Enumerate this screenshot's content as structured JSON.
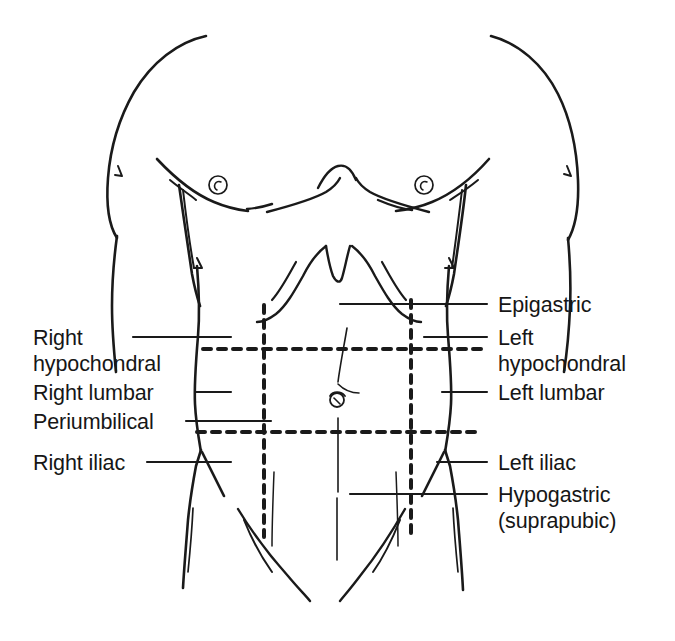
{
  "figure": {
    "stroke_color": "#1a1a1a",
    "background_color": "#ffffff",
    "text_color": "#161616"
  },
  "labels_left": [
    {
      "id": "right-hypochondral",
      "line1": "Right",
      "line2": "hypochondral",
      "x": 33,
      "y": 326,
      "leader": {
        "x1": 133,
        "y1": 337,
        "x2": 231,
        "y2": 337
      }
    },
    {
      "id": "right-lumbar",
      "line1": "Right lumbar",
      "line2": "",
      "x": 33,
      "y": 381,
      "leader": {
        "x1": 196,
        "y1": 392,
        "x2": 231,
        "y2": 392
      }
    },
    {
      "id": "periumbilical",
      "line1": "Periumbilical",
      "line2": "",
      "x": 33,
      "y": 410,
      "leader": {
        "x1": 186,
        "y1": 421,
        "x2": 271,
        "y2": 421
      }
    },
    {
      "id": "right-iliac",
      "line1": "Right iliac",
      "line2": "",
      "x": 33,
      "y": 451,
      "leader": {
        "x1": 147,
        "y1": 462,
        "x2": 231,
        "y2": 462
      }
    }
  ],
  "labels_right": [
    {
      "id": "epigastric",
      "line1": "Epigastric",
      "line2": "",
      "x": 498,
      "y": 293,
      "leader": {
        "x1": 340,
        "y1": 304,
        "x2": 487,
        "y2": 304
      }
    },
    {
      "id": "left-hypochondral",
      "line1": "Left",
      "line2": "hypochondral",
      "x": 498,
      "y": 326,
      "leader": {
        "x1": 424,
        "y1": 337,
        "x2": 487,
        "y2": 337
      }
    },
    {
      "id": "left-lumbar",
      "line1": "Left lumbar",
      "line2": "",
      "x": 498,
      "y": 381,
      "leader": {
        "x1": 442,
        "y1": 392,
        "x2": 487,
        "y2": 392
      }
    },
    {
      "id": "left-iliac",
      "line1": "Left iliac",
      "line2": "",
      "x": 498,
      "y": 451,
      "leader": {
        "x1": 437,
        "y1": 462,
        "x2": 487,
        "y2": 462
      }
    },
    {
      "id": "hypogastric",
      "line1": "Hypogastric",
      "line2": "(suprapubic)",
      "x": 498,
      "y": 483,
      "leader": {
        "x1": 350,
        "y1": 494,
        "x2": 487,
        "y2": 494
      }
    }
  ],
  "region_lines": {
    "vertical_left": {
      "id": "right-midclavicular-line",
      "x": 264,
      "y1": 305,
      "y2": 537
    },
    "vertical_right": {
      "id": "left-midclavicular-line",
      "x": 411,
      "y1": 300,
      "y2": 533
    },
    "horizontal_upper": {
      "id": "subcostal-plane",
      "y": 349,
      "x1": 203,
      "x2": 481
    },
    "horizontal_lower": {
      "id": "transtubercular-plane",
      "y": 432,
      "x1": 197,
      "x2": 478
    },
    "dash_pattern": "8 7",
    "dash_width": 4
  },
  "landmarks": {
    "nipple_right": {
      "cx": 218,
      "cy": 185,
      "r": 9
    },
    "nipple_left": {
      "cx": 424,
      "cy": 185,
      "r": 9
    },
    "umbilicus": {
      "cx": 337,
      "cy": 400,
      "r": 7
    }
  }
}
